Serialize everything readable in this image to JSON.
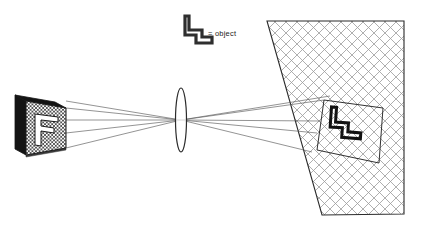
{
  "diagram": {
    "legend": {
      "equals_sign": "=",
      "label": "object"
    },
    "colors": {
      "ink": "#1a1a1a",
      "ray": "#4a4a4a",
      "hatch_screen": "#9a9a9a",
      "hatch_object": "#2b2b2b",
      "slab_dark": "#141414",
      "slab_mid": "#3a3a3a",
      "white": "#ffffff"
    },
    "parts": {
      "object_slab": "object slab with F aperture",
      "lens": "biconvex converging lens",
      "screen": "cross-hatched projection screen",
      "projected_image": "inverted projected image",
      "rays": "four principal ray pairs"
    },
    "geometry": {
      "lens_center_x": 181,
      "lens_center_y": 120,
      "lens_half_width": 5.5,
      "lens_half_height": 32,
      "object_face": {
        "tl_x": 26,
        "tl_y": 101,
        "tr_x": 66,
        "tr_y": 108,
        "br_x": 66,
        "br_y": 148,
        "bl_x": 26,
        "bl_y": 155
      },
      "object_depth_x": -11,
      "object_depth_y": -6,
      "screen_quad": {
        "tl_x": 267,
        "tl_y": 21,
        "tr_x": 404,
        "tr_y": 21,
        "br_x": 404,
        "br_y": 214,
        "bl_x": 322,
        "bl_y": 215
      },
      "image_quad": {
        "tl_x": 324,
        "tl_y": 100,
        "tr_x": 383,
        "tr_y": 108,
        "br_x": 379,
        "br_y": 163,
        "bl_x": 317,
        "bl_y": 150
      },
      "legend_glyph": {
        "x": 186,
        "y": 14,
        "w": 26,
        "h": 30
      },
      "legend_text": {
        "equals_x": 208,
        "equals_y": 36,
        "label_x": 216,
        "label_y": 36
      },
      "ray_endpoints_left": [
        {
          "x": 66,
          "y": 108
        },
        {
          "x": 66,
          "y": 120
        },
        {
          "x": 66,
          "y": 133
        },
        {
          "x": 66,
          "y": 148
        }
      ],
      "ray_endpoints_right": [
        {
          "x": 324,
          "y": 100
        },
        {
          "x": 320,
          "y": 121
        },
        {
          "x": 317,
          "y": 133
        },
        {
          "x": 312,
          "y": 152
        }
      ]
    }
  }
}
